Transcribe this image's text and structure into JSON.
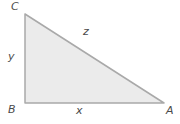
{
  "diagram": {
    "type": "right-triangle",
    "vertices": [
      {
        "label": "C",
        "position": "top-left"
      },
      {
        "label": "B",
        "position": "bottom-left"
      },
      {
        "label": "A",
        "position": "bottom-right"
      }
    ],
    "sides": [
      {
        "label": "y",
        "between": "B and C",
        "position": "left-vertical"
      },
      {
        "label": "x",
        "between": "B and A",
        "position": "bottom-horizontal"
      },
      {
        "label": "z",
        "between": "C and A",
        "position": "hypotenuse"
      }
    ]
  },
  "colors": {
    "background": "#ffffff",
    "triangle_fill": "#ebebeb",
    "triangle_stroke": "#a9a9a9",
    "label_text": "#4a4a4a"
  }
}
